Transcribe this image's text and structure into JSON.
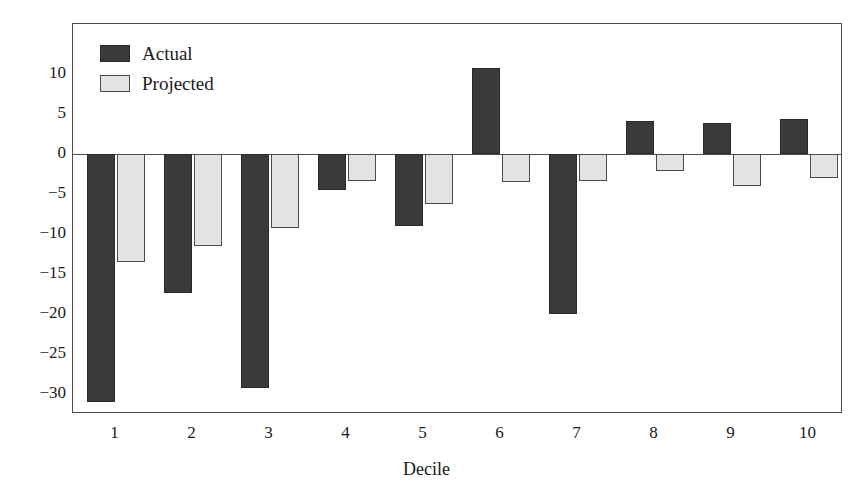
{
  "top_stub_text": "",
  "chart_data": {
    "type": "bar",
    "title": "",
    "xlabel": "Decile",
    "ylabel": "",
    "categories": [
      "1",
      "2",
      "3",
      "4",
      "5",
      "6",
      "7",
      "8",
      "9",
      "10"
    ],
    "series": [
      {
        "name": "Actual",
        "color": "#3a3a3a",
        "values": [
          -31.0,
          -17.4,
          -29.3,
          -4.5,
          -9.0,
          10.7,
          -20.0,
          4.1,
          3.9,
          4.4
        ]
      },
      {
        "name": "Projected",
        "color": "#e3e3e3",
        "values": [
          -13.5,
          -11.5,
          -9.3,
          -3.4,
          -6.2,
          -3.5,
          -3.4,
          -2.1,
          -4.0,
          -3.0
        ]
      }
    ],
    "ylim": [
      -32.5,
      16.25
    ],
    "yticks": [
      10,
      5,
      0,
      -5,
      -10,
      -15,
      -20,
      -25,
      -30
    ],
    "ytick_labels": [
      "10",
      "5",
      "0",
      "−5",
      "−10",
      "−15",
      "−20",
      "−25",
      "−30"
    ],
    "grid": false,
    "zero_line": true,
    "legend": {
      "position": "top-left",
      "entries": [
        {
          "label": "Actual",
          "swatch": "actual"
        },
        {
          "label": "Projected",
          "swatch": "projected"
        }
      ]
    },
    "axis_frame": true
  }
}
